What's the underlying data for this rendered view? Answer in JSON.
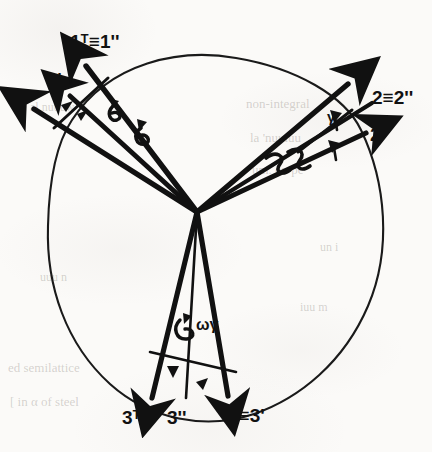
{
  "figure": {
    "ink_color": "#111111",
    "paper_color": "#fbfaf8",
    "origin": {
      "x": 197,
      "y": 212
    }
  },
  "labels": {
    "axis1": {
      "plain": "1",
      "prime": "1'",
      "transpose_equiv": "1ᵀ≡1''"
    },
    "axis2": {
      "plain": "2",
      "equiv": "2≡2''",
      "transpose": "2ᵀ"
    },
    "axis3": {
      "transpose": "3ᵀ",
      "double_prime": "3''",
      "equiv": "3≡3'"
    }
  },
  "annotations": {
    "rot_gamma_upper_left": "γ",
    "rot_omega_upper_left": "ω",
    "rot_gamma_right": "γ",
    "rot_psi_right": "ψ",
    "rot_zeta_right": "ʒʒ",
    "rot_omega_gamma_bottom": "ωγ",
    "rot_arrow_bottom_left": "γ",
    "rot_arrow_bottom_right": "γ"
  },
  "ghost_text": [
    {
      "text": "non-integral",
      "x": 246,
      "y": 96,
      "size": 13,
      "rot": 0
    },
    {
      "text": "la 'nuuiuu",
      "x": 250,
      "y": 130,
      "size": 13,
      "rot": 0
    },
    {
      "text": "um. on pe",
      "x": 252,
      "y": 162,
      "size": 13,
      "rot": 0
    },
    {
      "text": "al nuuuw",
      "x": 30,
      "y": 100,
      "size": 12,
      "rot": 0
    },
    {
      "text": "uuu n",
      "x": 40,
      "y": 270,
      "size": 12,
      "rot": 0
    },
    {
      "text": "ed semilattice",
      "x": 8,
      "y": 360,
      "size": 13,
      "rot": 0
    },
    {
      "text": "[ in α of steel",
      "x": 10,
      "y": 394,
      "size": 13,
      "rot": 0
    },
    {
      "text": "iuu m",
      "x": 300,
      "y": 300,
      "size": 12,
      "rot": 0
    },
    {
      "text": "un i",
      "x": 320,
      "y": 240,
      "size": 12,
      "rot": 0
    }
  ],
  "vectors": [
    {
      "name": "axis-1",
      "label": "1",
      "tip": {
        "x": 27,
        "y": 106
      }
    },
    {
      "name": "axis-1-prime",
      "label": "1'",
      "tip": {
        "x": 64,
        "y": 88
      }
    },
    {
      "name": "axis-1-transpose",
      "label": "1ᵀ≡1''",
      "tip": {
        "x": 80,
        "y": 56
      }
    },
    {
      "name": "axis-2",
      "label": "2",
      "tip": {
        "x": 356,
        "y": 79
      }
    },
    {
      "name": "axis-2-equiv",
      "label": "2≡2''",
      "tip": {
        "x": 382,
        "y": 100
      }
    },
    {
      "name": "axis-2-transpose",
      "label": "2ᵀ",
      "tip": {
        "x": 378,
        "y": 134
      }
    },
    {
      "name": "axis-3-transpose",
      "label": "3ᵀ",
      "tip": {
        "x": 149,
        "y": 406
      }
    },
    {
      "name": "axis-3-double",
      "label": "3''",
      "tip": {
        "x": 184,
        "y": 404
      }
    },
    {
      "name": "axis-3-equiv",
      "label": "3≡3'",
      "tip": {
        "x": 232,
        "y": 404
      }
    }
  ]
}
